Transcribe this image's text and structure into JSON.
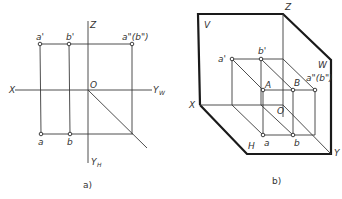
{
  "figure_a": {
    "caption": "a)",
    "axes": {
      "x": "X",
      "z": "Z",
      "origin": "O",
      "yw_main": "Y",
      "yw_sub": "W",
      "yh_main": "Y",
      "yh_sub": "H"
    },
    "points": {
      "a_prime": "a'",
      "b_prime": "b'",
      "a_dprime": "a\"(b\")",
      "a": "a",
      "b": "b"
    }
  },
  "figure_b": {
    "caption": "b)",
    "planes": {
      "v": "V",
      "w": "W",
      "h": "H"
    },
    "axes": {
      "x": "X",
      "y": "Y",
      "z": "Z",
      "origin": "O"
    },
    "points": {
      "a_prime": "a'",
      "b_prime": "b'",
      "A": "A",
      "B": "B",
      "a_dprime": "a\"(b\")",
      "a": "a",
      "b": "b"
    }
  }
}
